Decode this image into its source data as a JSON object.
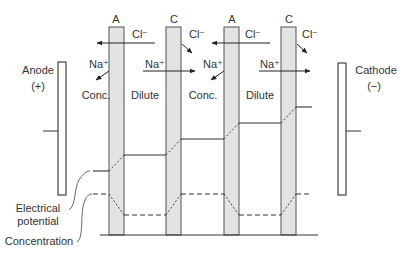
{
  "electrodes": {
    "anode": {
      "label": "Anode",
      "sign": "(+)"
    },
    "cathode": {
      "label": "Cathode",
      "sign": "(−)"
    }
  },
  "membranes": [
    {
      "type": "A"
    },
    {
      "type": "C"
    },
    {
      "type": "A"
    },
    {
      "type": "C"
    }
  ],
  "compartments": [
    {
      "label": "Conc."
    },
    {
      "label": "Dilute"
    },
    {
      "label": "Conc."
    },
    {
      "label": "Dilute"
    }
  ],
  "ions": {
    "chloride": "Cl⁻",
    "sodium": "Na⁺"
  },
  "legend": {
    "electrical_potential": [
      "Electrical",
      "potential"
    ],
    "concentration": "Concentration"
  },
  "colors": {
    "membrane_fill": "#e3e3e3",
    "line": "#333333"
  }
}
